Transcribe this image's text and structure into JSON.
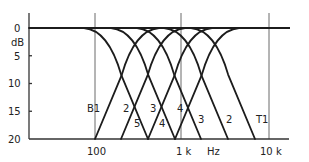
{
  "chart_data": {
    "type": "line",
    "title": "",
    "xlabel": "Hz",
    "ylabel": "dB",
    "x_scale": "log",
    "y_inverted": true,
    "ylim": [
      0,
      20
    ],
    "xlim_hz": [
      16,
      20000
    ],
    "y_ticks": [
      0,
      5,
      10,
      15,
      20
    ],
    "y_tick_labels": [
      "0",
      "5",
      "10",
      "15",
      "20"
    ],
    "x_ticks": [
      100,
      1000,
      10000
    ],
    "x_tick_labels": [
      "100",
      "1 k",
      "10 k"
    ],
    "grid": "vertical at 100 Hz, 1 kHz, 10 kHz",
    "series": [
      {
        "name": "B1",
        "kind": "high-pass",
        "reaches_20dB_hz": 100,
        "flat_from_hz": 560
      },
      {
        "name": "2",
        "kind": "high-pass",
        "reaches_20dB_hz": 200,
        "flat_from_hz": 1120
      },
      {
        "name": "3",
        "kind": "high-pass",
        "reaches_20dB_hz": 400,
        "flat_from_hz": 2240
      },
      {
        "name": "4",
        "kind": "high-pass",
        "reaches_20dB_hz": 800,
        "flat_from_hz": 4480
      },
      {
        "name": "5",
        "kind": "low-pass",
        "flat_to_hz": 72,
        "reaches_20dB_hz": 400
      },
      {
        "name": "4",
        "kind": "low-pass",
        "flat_to_hz": 144,
        "reaches_20dB_hz": 800
      },
      {
        "name": "3",
        "kind": "low-pass",
        "flat_to_hz": 288,
        "reaches_20dB_hz": 1600
      },
      {
        "name": "2",
        "kind": "low-pass",
        "flat_to_hz": 576,
        "reaches_20dB_hz": 3200
      },
      {
        "name": "T1",
        "kind": "low-pass",
        "flat_to_hz": 1152,
        "reaches_20dB_hz": 6400
      }
    ]
  },
  "labels": {
    "y_unit": "dB",
    "x_unit": "Hz",
    "y0": "0",
    "y5": "5",
    "y10": "10",
    "y15": "15",
    "y20": "20",
    "x100": "100",
    "x1k": "1 k",
    "x10k": "10 k",
    "curves": [
      {
        "text": "B1",
        "x": 87,
        "y": 112
      },
      {
        "text": "2",
        "x": 123,
        "y": 112
      },
      {
        "text": "3",
        "x": 150,
        "y": 112
      },
      {
        "text": "4",
        "x": 177,
        "y": 112
      },
      {
        "text": "5",
        "x": 134,
        "y": 127
      },
      {
        "text": "4",
        "x": 159,
        "y": 127
      },
      {
        "text": "3",
        "x": 198,
        "y": 123
      },
      {
        "text": "2",
        "x": 226,
        "y": 123
      },
      {
        "text": "T1",
        "x": 256,
        "y": 123
      }
    ]
  },
  "geometry": {
    "axis_x": 29,
    "axis_top": 13,
    "y0_px": 28,
    "y20_px": 139,
    "x_end": 289,
    "x100_px": 95,
    "x1k_px": 181,
    "x10k_px": 269,
    "grid_top": 13,
    "highpass_bottom_x": [
      95,
      121,
      148,
      175
    ],
    "lowpass_bottom_x": [
      148,
      175,
      201,
      228,
      255
    ],
    "flat_run_px": 64
  }
}
